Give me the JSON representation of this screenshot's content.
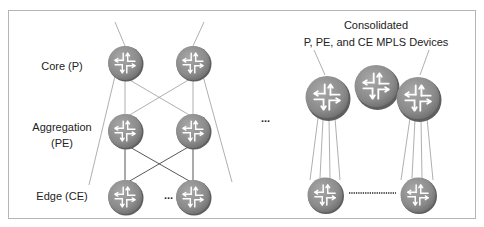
{
  "diagram": {
    "title_line1": "Consolidated",
    "title_line2": "P, PE, and CE MPLS Devices",
    "layers": {
      "core": "Core (P)",
      "aggregation_line1": "Aggregation",
      "aggregation_line2": "(PE)",
      "edge": "Edge (CE)"
    },
    "ellipsis_edge": "...",
    "ellipsis_middle": "...",
    "colors": {
      "router_fill": "#8c8c8c",
      "router_edge": "#5e5e5e",
      "line": "#9a9a9a",
      "line_dark": "#444444",
      "frame": "#b5b5b5"
    }
  }
}
